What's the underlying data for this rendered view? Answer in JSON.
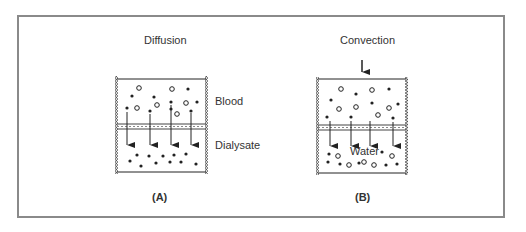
{
  "figure": {
    "panels": [
      {
        "id": "A",
        "title": "Diffusion",
        "panel_label": "(A)",
        "labels": {
          "upper": "Blood",
          "lower": "Dialysate"
        }
      },
      {
        "id": "B",
        "title": "Convection",
        "panel_label": "(B)",
        "labels": {
          "lower_inside": "Water"
        }
      }
    ],
    "colors": {
      "frame": "#8a8a8a",
      "ink": "#222222"
    }
  }
}
